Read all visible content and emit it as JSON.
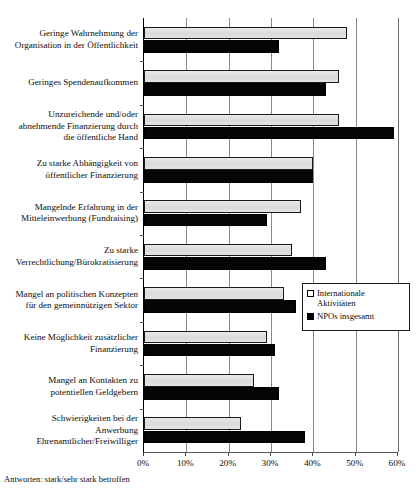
{
  "chart_data": {
    "type": "bar",
    "orientation": "horizontal",
    "title": "",
    "xlabel": "",
    "ylabel": "",
    "xlim": [
      0,
      60
    ],
    "xunit": "%",
    "grid": true,
    "legend_position": "middle-right",
    "xticks": [
      "0%",
      "10%",
      "20%",
      "30%",
      "40%",
      "50%",
      "60%"
    ],
    "xtick_values": [
      0,
      10,
      20,
      30,
      40,
      50,
      60
    ],
    "categories": [
      "Geringe Wahrnehmung der Organisation in der Öffentlichkeit",
      "Geringes Spendenaufkommen",
      "Unzureichende und/oder abnehmende Finanzierung durch die öffentliche Hand",
      "Zu starke Abhängigkeit von öffentlicher Finanzierung",
      "Mangelnde Erfahrung in der Mitteleinwerbung (Fundraising)",
      "Zu starke Verrechtlichung/Bürokratisierung",
      "Mangel an politischen Konzepten für den gemeinnützigen Sektor",
      "Keine Möglichkeit zusätzlicher Finanzierung",
      "Mangel an Kontakten zu potentiellen Geldgebern",
      "Schwierigkeiten bei der Anwerbung Ehrenamtlicher/Freiwilliger"
    ],
    "category_lines": [
      [
        "Geringe Wahrnehmung der",
        "Organisation in der Öffentlichkeit"
      ],
      [
        "Geringes Spendenaufkommen"
      ],
      [
        "Unzureichende und/oder",
        "abnehmende Finanzierung durch",
        "die öffentliche Hand"
      ],
      [
        "Zu starke Abhängigkeit von",
        "öffentlicher Finanzierung"
      ],
      [
        "Mangelnde Erfahrung in der",
        "Mitteleinwerbung (Fundraising)"
      ],
      [
        "Zu starke",
        "Verrechtlichung/Bürokratisierung"
      ],
      [
        "Mangel an politischen Konzepten",
        "für den gemeinnützigen Sektor"
      ],
      [
        "Keine Möglichkeit zusätzlicher",
        "Finanzierung"
      ],
      [
        "Mangel an Kontakten zu",
        "potentiellen Geldgebern"
      ],
      [
        "Schwierigkeiten bei der",
        "Anwerbung",
        "Ehrenamtlicher/Freiwilliger"
      ]
    ],
    "series": [
      {
        "name": "Internationale Aktivitäten",
        "name_lines": [
          "Internationale",
          "Aktivitäten"
        ],
        "color": "#e2e2e2",
        "values": [
          48,
          46,
          46,
          40,
          37,
          35,
          33,
          29,
          26,
          23
        ]
      },
      {
        "name": "NPOs insgesamt",
        "name_lines": [
          "NPOs insgesamt"
        ],
        "color": "#050505",
        "values": [
          32,
          43,
          59,
          40,
          29,
          43,
          36,
          31,
          32,
          38
        ]
      }
    ]
  },
  "footnote": "Antworten: stark/sehr stark betroffen"
}
